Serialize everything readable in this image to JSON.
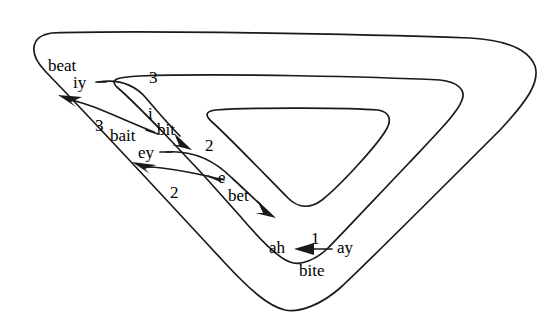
{
  "figure": {
    "background_color": "#ffffff",
    "stroke_color": "#1a1a1a",
    "width": 554,
    "height": 325
  },
  "labels": {
    "beat": "beat",
    "iy": "iy",
    "bait": "bait",
    "ey": "ey",
    "bit": "bit",
    "i": "i",
    "bet": "bet",
    "e": "e",
    "bite": "bite",
    "ay": "ay",
    "ah": "ah"
  },
  "arrow_numbers": {
    "three_top": "3",
    "three_left": "3",
    "two_mid": "2",
    "two_left": "2",
    "one_bottom": "1"
  },
  "arrows": [
    {
      "name": "iy-to-bit",
      "number": "3",
      "from": "iy",
      "to": "i",
      "direction": "down-right"
    },
    {
      "name": "i-to-iy",
      "number": "3",
      "from": "i",
      "to": "iy",
      "direction": "up-left"
    },
    {
      "name": "ey-to-bet",
      "number": "2",
      "from": "ey",
      "to": "e",
      "direction": "down-right"
    },
    {
      "name": "e-to-ey",
      "number": "2",
      "from": "e",
      "to": "ey",
      "direction": "up-left"
    },
    {
      "name": "ay-to-ah",
      "number": "1",
      "from": "ay",
      "to": "ah",
      "direction": "left"
    }
  ],
  "contours": [
    {
      "name": "outer-triangle"
    },
    {
      "name": "middle-triangle"
    },
    {
      "name": "inner-triangle"
    }
  ]
}
